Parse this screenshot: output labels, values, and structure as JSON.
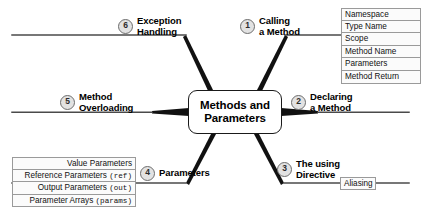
{
  "diagram": {
    "type": "mind-map",
    "center": {
      "title_line1": "Methods and",
      "title_line2": "Parameters"
    },
    "branches": [
      {
        "number": "1",
        "label_line1": "Calling",
        "label_line2": "a Method",
        "position": "upper-right"
      },
      {
        "number": "2",
        "label_line1": "Declaring",
        "label_line2": "a Method",
        "position": "right"
      },
      {
        "number": "3",
        "label_line1": "The using",
        "label_line2": "Directive",
        "position": "lower-right"
      },
      {
        "number": "4",
        "label_line1": "Parameters",
        "label_line2": "",
        "position": "lower-left"
      },
      {
        "number": "5",
        "label_line1": "Method",
        "label_line2": "Overloading",
        "position": "left"
      },
      {
        "number": "6",
        "label_line1": "Exception",
        "label_line2": "Handling",
        "position": "upper-left"
      }
    ],
    "calling_a_method_items": [
      "Namespace",
      "Type Name",
      "Scope",
      "Method Name",
      "Parameters",
      "Method Return"
    ],
    "parameters_items": [
      {
        "text": "Value Parameters",
        "code": ""
      },
      {
        "text": "Reference Parameters ",
        "code": "(ref)"
      },
      {
        "text": "Output Parameters ",
        "code": "(out)"
      },
      {
        "text": "Parameter Arrays ",
        "code": "(params)"
      }
    ],
    "using_directive_items": [
      "Aliasing"
    ],
    "colors": {
      "stroke": "#1a1a1a",
      "branch_line": "#4a4a4a",
      "box_border": "#9a9a9a",
      "box_fill": "#fbfbfb",
      "number_fill": "#e2e2e2",
      "background": "#ffffff"
    }
  }
}
